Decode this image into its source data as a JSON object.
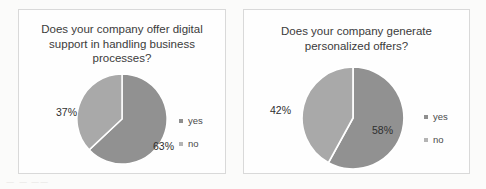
{
  "background_color": "#fbfbfa",
  "ghost_text": {
    "line1": "ㅡ  ㅡ  ㅡㅡ",
    "line2": "ㅡ ㅡ  ㅡㅡㅡ  ㅡ",
    "line3": "ㅡ   ㅡㅡ",
    "line4": "ㅡㅡ ㅡㅡ"
  },
  "charts": [
    {
      "id": "digital-support",
      "title": "Does your company offer digital\nsupport in handling business\nprocesses?",
      "chart_data": {
        "type": "pie",
        "title": "Does your company offer digital support in handling business processes?",
        "categories": [
          "yes",
          "no"
        ],
        "values": [
          63,
          37
        ],
        "value_labels": [
          "63%",
          "37%"
        ],
        "unit": "percent",
        "start_angle_deg": 0,
        "direction": "clockwise",
        "colors": [
          "#919191",
          "#a9a9a9"
        ],
        "legend_position": "right",
        "grid": false
      },
      "labels": {
        "yes": "63%",
        "no": "37%"
      },
      "legend": [
        {
          "label": "yes",
          "color": "#8f8f8f"
        },
        {
          "label": "no",
          "color": "#b4b4b4"
        }
      ]
    },
    {
      "id": "personalized-offers",
      "title": "Does your company generate\npersonalized offers?",
      "chart_data": {
        "type": "pie",
        "title": "Does your company generate personalized offers?",
        "categories": [
          "yes",
          "no"
        ],
        "values": [
          58,
          42
        ],
        "value_labels": [
          "58%",
          "42%"
        ],
        "unit": "percent",
        "start_angle_deg": 0,
        "direction": "clockwise",
        "colors": [
          "#919191",
          "#a9a9a9"
        ],
        "legend_position": "right",
        "grid": false
      },
      "labels": {
        "yes": "58%",
        "no": "42%"
      },
      "legend": [
        {
          "label": "yes",
          "color": "#8f8f8f"
        },
        {
          "label": "no",
          "color": "#b4b4b4"
        }
      ]
    }
  ]
}
